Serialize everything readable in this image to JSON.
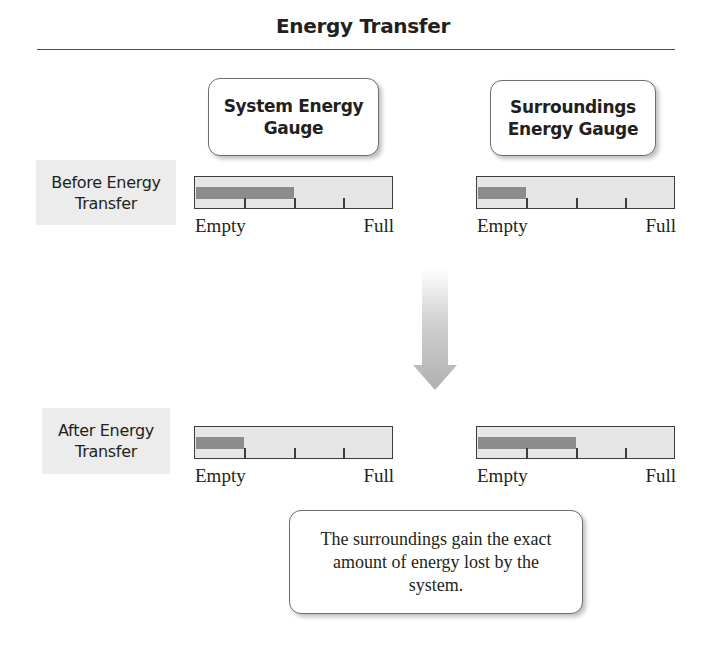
{
  "title": "Energy Transfer",
  "columns": [
    {
      "label": "System Energy\nGauge"
    },
    {
      "label": "Surroundings\nEnergy Gauge"
    }
  ],
  "rows": [
    {
      "label": "Before Energy\nTransfer"
    },
    {
      "label": "After Energy\nTransfer"
    }
  ],
  "gauges": {
    "before_system": {
      "fill_fraction": 0.5,
      "scale_min_label": "Empty",
      "scale_max_label": "Full"
    },
    "before_surroundings": {
      "fill_fraction": 0.25,
      "scale_min_label": "Empty",
      "scale_max_label": "Full"
    },
    "after_system": {
      "fill_fraction": 0.25,
      "scale_min_label": "Empty",
      "scale_max_label": "Full"
    },
    "after_surroundings": {
      "fill_fraction": 0.5,
      "scale_min_label": "Empty",
      "scale_max_label": "Full"
    }
  },
  "gauge_ticks": 3,
  "arrow": {
    "direction": "down",
    "icon": "down-arrow-icon"
  },
  "callout": "The surroundings gain the exact amount of energy lost by the system.",
  "colors": {
    "gauge_background": "#e6e6e6",
    "gauge_fill": "#8c8c8c",
    "row_label_background": "#ececec",
    "arrow": "#b5b5b5"
  }
}
